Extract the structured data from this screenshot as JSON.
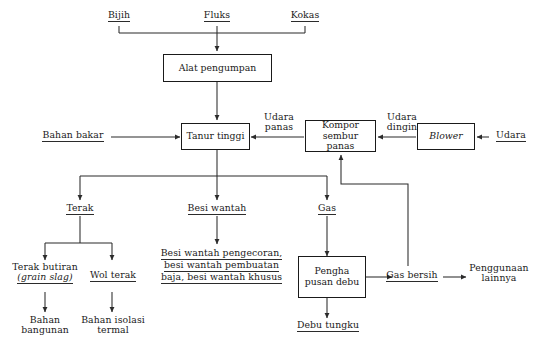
{
  "diagram": {
    "type": "process-flowchart",
    "language": "id"
  },
  "inputs": {
    "ore": "Bijih",
    "flux": "Fluks",
    "coke": "Kokas",
    "fuel": "Bahan bakar",
    "air": "Udara"
  },
  "boxes": {
    "feeder": "Alat pengumpan",
    "blast_furnace": "Tanur tinggi",
    "hot_stove_line1": "Kompor",
    "hot_stove_line2": "sembur panas",
    "blower": "Blower",
    "dust_removal_line1": "Pengha",
    "dust_removal_line2": "pusan debu"
  },
  "streams": {
    "hot_air_line1": "Udara",
    "hot_air_line2": "panas",
    "cold_air_line1": "Udara",
    "cold_air_line2": "dingin"
  },
  "outputs": {
    "slag": "Terak",
    "pig_iron": "Besi wantah",
    "gas": "Gas"
  },
  "slag_products": {
    "granulated_line1": "Terak butiran",
    "granulated_line2": "(grain slag)",
    "wool": "Wol terak",
    "building_material_line1": "Bahan",
    "building_material_line2": "bangunan",
    "insulation_line1": "Bahan isolasi",
    "insulation_line2": "termal"
  },
  "iron_products": {
    "line1": "Besi wantah pengecoran,",
    "line2": "besi wantah pembuatan",
    "line3": "baja, besi wantah khusus"
  },
  "gas_products": {
    "clean_gas": "Gas bersih",
    "other_use_line1": "Penggunaan",
    "other_use_line2": "lainnya",
    "furnace_dust": "Debu tungku"
  },
  "style": {
    "line_color": "#2b2b2b",
    "text_color": "#1a1a1a",
    "background": "#ffffff"
  }
}
